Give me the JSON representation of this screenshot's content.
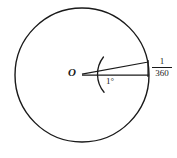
{
  "figure": {
    "type": "geometry-diagram",
    "background_color": "#ffffff",
    "stroke_color": "#1a1a1a"
  },
  "labels": {
    "center": "O",
    "angle": "1°",
    "arc_fraction_numerator": "1",
    "arc_fraction_denominator": "360"
  },
  "geometry": {
    "circle": {
      "center_x": 82,
      "center_y": 75,
      "radius": 67,
      "stroke_width": 1.4
    },
    "radius_lower": {
      "from_x": 82,
      "from_y": 75,
      "to_x": 149,
      "to_y": 75
    },
    "radius_upper": {
      "from_x": 82,
      "from_y": 75,
      "to_x": 148.3,
      "to_y": 62
    },
    "angle_arc": {
      "center_x": 82,
      "center_y": 75,
      "radius": 28,
      "start_deg": -38,
      "end_deg": 40
    },
    "arc_tick": {
      "x": 148,
      "y_top": 60,
      "y_bottom": 77
    }
  }
}
